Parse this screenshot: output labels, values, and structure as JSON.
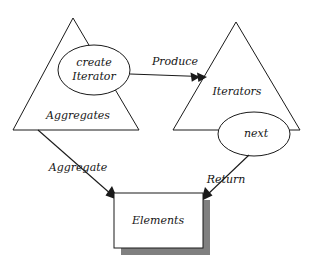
{
  "diagram": {
    "type": "uml-collaboration-diagram",
    "background_color": "#ffffff",
    "stroke_color": "#1a1a1a",
    "shadow_color": "#808080",
    "nodes": [
      {
        "id": "aggregates",
        "shape": "triangle",
        "label": "Aggregates",
        "apex": [
          73,
          18
        ],
        "base_left": [
          13,
          130
        ],
        "base_right": [
          139,
          130
        ],
        "label_pos": [
          78,
          116
        ]
      },
      {
        "id": "create-iterator",
        "shape": "ellipse",
        "label_line1": "create",
        "label_line2": "Iterator",
        "cx": 94,
        "cy": 70,
        "rx": 36,
        "ry": 25
      },
      {
        "id": "iterators",
        "shape": "triangle",
        "label": "Iterators",
        "apex": [
          236,
          22
        ],
        "base_left": [
          173,
          130
        ],
        "base_right": [
          300,
          130
        ],
        "label_pos": [
          237,
          92
        ]
      },
      {
        "id": "next",
        "shape": "ellipse",
        "label": "next",
        "cx": 254,
        "cy": 134,
        "rx": 36,
        "ry": 22
      },
      {
        "id": "elements",
        "shape": "rectangle",
        "label": "Elements",
        "x": 114,
        "y": 193,
        "width": 89,
        "height": 55,
        "shadow_offset": 7,
        "label_pos": [
          158,
          221
        ]
      }
    ],
    "edges": [
      {
        "id": "produce",
        "label": "Produce",
        "from": "create-iterator",
        "to": "iterators",
        "start": [
          130,
          74
        ],
        "end": [
          206,
          77
        ],
        "label_pos": [
          175,
          62
        ]
      },
      {
        "id": "aggregate",
        "label": "Aggregate",
        "from": "aggregates",
        "to": "elements",
        "start": [
          38,
          130
        ],
        "end": [
          117,
          200
        ],
        "label_pos": [
          78,
          168
        ]
      },
      {
        "id": "return",
        "label": "Return",
        "from": "next",
        "to": "elements",
        "start": [
          249,
          155
        ],
        "end": [
          202,
          200
        ],
        "label_pos": [
          226,
          180
        ]
      }
    ]
  }
}
